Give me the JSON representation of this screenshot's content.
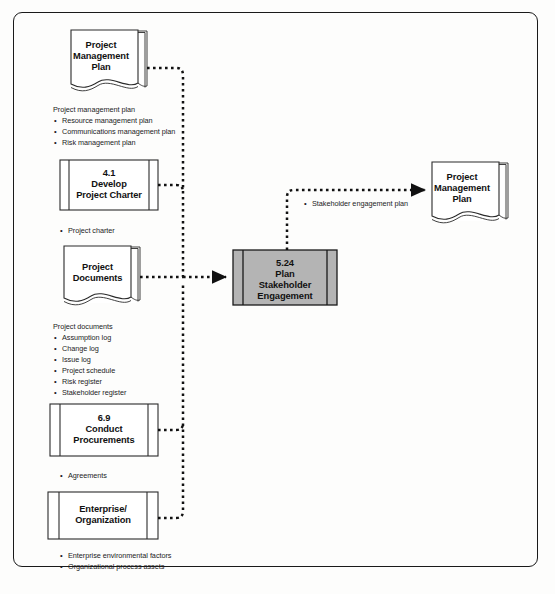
{
  "diagram": {
    "type": "data-flow-diagram",
    "colors": {
      "process_fill": "#b4b4b4",
      "document_fill": "#ffffff",
      "line": "#111111",
      "page_background": "#fdfdfc"
    }
  },
  "process": {
    "id": "5.24",
    "name_line1": "Plan",
    "name_line2": "Stakeholder",
    "name_line3": "Engagement",
    "shape": "predefined-process",
    "fill": "#b4b4b4"
  },
  "inputs": [
    {
      "shape": "document",
      "label_line1": "Project",
      "label_line2": "Management",
      "label_line3": "Plan",
      "note_head": "Project management plan",
      "items": [
        "Resource management plan",
        "Communications management plan",
        "Risk management plan"
      ]
    },
    {
      "shape": "process",
      "label_line1": "4.1",
      "label_line2": "Develop",
      "label_line3": "Project Charter",
      "note_head": "",
      "items": [
        "Project charter"
      ]
    },
    {
      "shape": "document",
      "label_line1": "Project",
      "label_line2": "Documents",
      "label_line3": "",
      "note_head": "Project documents",
      "items": [
        "Assumption log",
        "Change log",
        "Issue log",
        "Project schedule",
        "Risk register",
        "Stakeholder register"
      ]
    },
    {
      "shape": "process",
      "label_line1": "6.9",
      "label_line2": "Conduct",
      "label_line3": "Procurements",
      "note_head": "",
      "items": [
        "Agreements"
      ]
    },
    {
      "shape": "process",
      "label_line1": "Enterprise/",
      "label_line2": "Organization",
      "label_line3": "",
      "note_head": "",
      "items": [
        "Enterprise environmental factors",
        "Organizational process assets"
      ]
    }
  ],
  "outputs": [
    {
      "shape": "document",
      "label_line1": "Project",
      "label_line2": "Management",
      "label_line3": "Plan",
      "note_head": "",
      "items": [
        "Stakeholder engagement plan"
      ]
    }
  ]
}
